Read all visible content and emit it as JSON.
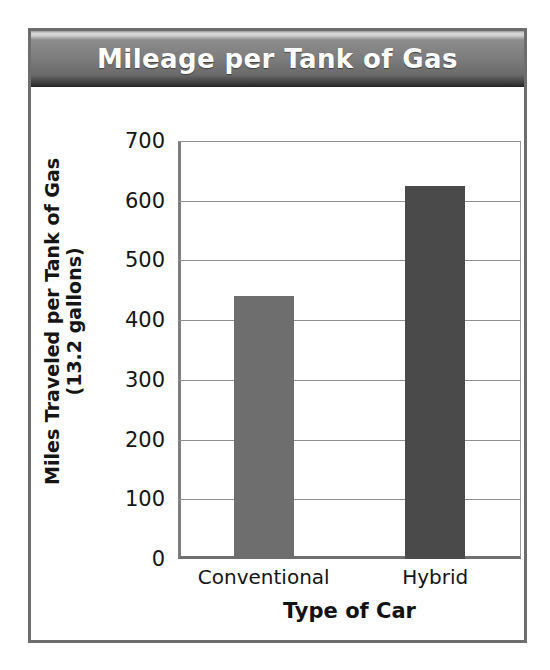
{
  "figure": {
    "title": "Mileage per Tank of Gas",
    "frame_color": "#6d6d6d",
    "banner_color": "#7d7d7d",
    "banner_text_color": "#ffffff"
  },
  "chart_data": {
    "type": "bar",
    "title": "Mileage per Tank of Gas",
    "categories": [
      "Conventional",
      "Hybrid"
    ],
    "values": [
      440,
      625
    ],
    "series": [
      {
        "name": "Miles Traveled per Tank of Gas (13.2 gallons)",
        "values": [
          440,
          625
        ]
      }
    ],
    "bar_colors": [
      "#6e6e6e",
      "#4a4a4a"
    ],
    "xlabel": "Type of Car",
    "ylabel": "Miles Traveled per Tank of Gas",
    "ylabel_line2": "(13.2 gallons)",
    "ylim": [
      0,
      700
    ],
    "ytick_step": 100,
    "yticks": [
      0,
      100,
      200,
      300,
      400,
      500,
      600,
      700
    ],
    "ytick_labels": [
      "0",
      "100",
      "200",
      "300",
      "400",
      "500",
      "600",
      "700"
    ],
    "grid": true,
    "grid_axis": "y",
    "legend": false,
    "legend_position": "none"
  }
}
